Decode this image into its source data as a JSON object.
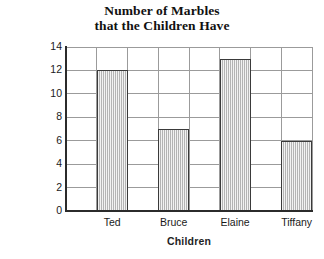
{
  "chart_data": {
    "type": "bar",
    "title": "Number of Marbles that the Children Have",
    "title_lines": [
      "Number of Marbles",
      "that the Children Have"
    ],
    "categories": [
      "Ted",
      "Bruce",
      "Elaine",
      "Tiffany"
    ],
    "values": [
      12,
      7,
      13,
      6
    ],
    "xlabel": "Children",
    "ylabel": "No. of Marbles",
    "ylim": [
      0,
      14
    ],
    "ytick_values": [
      0,
      2,
      4,
      6,
      8,
      10,
      12,
      14
    ],
    "ytick_labels": [
      "0",
      "2",
      "4",
      "6",
      "8",
      "10",
      "12",
      "14"
    ],
    "grid": true,
    "grid_axis": "both",
    "legend": false,
    "legend_position": "none",
    "bar_fill_color": "#cccccc",
    "bar_edge_color": "#3a3a3a",
    "grid_color": "#9b9b9b",
    "axis_color": "#2b2b2b",
    "background_color": "#ffffff",
    "series": [
      {
        "name": "No. of Marbles",
        "values": [
          12,
          7,
          13,
          6
        ]
      }
    ]
  }
}
